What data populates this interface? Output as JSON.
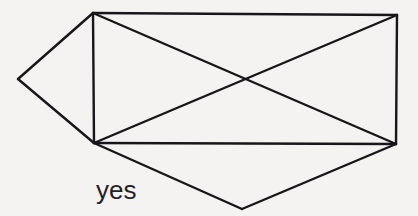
{
  "figure": {
    "caption": "yes",
    "background_color": "#f4f3f1",
    "stroke_color": "#17161a",
    "stroke_width": 2.4,
    "width": 418,
    "height": 216,
    "vertices": {
      "top_left": [
        93,
        13
      ],
      "top_right": [
        397,
        15
      ],
      "bottom_right": [
        396,
        144
      ],
      "bottom_left": [
        94,
        143
      ],
      "left_point": [
        18,
        79
      ],
      "bottom_point": [
        242,
        209
      ],
      "diagonal_crossing": [
        243,
        79
      ]
    },
    "edges": [
      {
        "name": "rect-top",
        "from": "top_left",
        "to": "top_right",
        "points": "93,13 397,15"
      },
      {
        "name": "rect-right",
        "from": "top_right",
        "to": "bottom_right",
        "points": "397,15 396,144"
      },
      {
        "name": "rect-bottom",
        "from": "bottom_right",
        "to": "bottom_left",
        "points": "396,144 94,143"
      },
      {
        "name": "rect-left",
        "from": "bottom_left",
        "to": "top_left",
        "points": "94,143 93,13"
      },
      {
        "name": "diagonal-tl-br",
        "from": "top_left",
        "to": "bottom_right",
        "points": "93,13 396,144"
      },
      {
        "name": "diagonal-bl-tr",
        "from": "bottom_left",
        "to": "top_right",
        "points": "94,143 397,15"
      },
      {
        "name": "left-triangle-upper",
        "from": "top_left",
        "to": "left_point",
        "points": "93,13 18,79"
      },
      {
        "name": "left-triangle-lower",
        "from": "left_point",
        "to": "bottom_left",
        "points": "18,79 94,143"
      },
      {
        "name": "bottom-triangle-left",
        "from": "bottom_left",
        "to": "bottom_point",
        "points": "94,143 242,209"
      },
      {
        "name": "bottom-triangle-right",
        "from": "bottom_point",
        "to": "bottom_right",
        "points": "242,209 396,144"
      }
    ]
  }
}
